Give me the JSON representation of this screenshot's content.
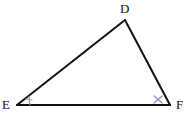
{
  "figure": {
    "kind": "geometry-diagram",
    "shape_name": "triangle",
    "background_color": "#ffffff",
    "stroke_color": "#111111",
    "stroke_width": 2,
    "mark_color": "#8a93b5",
    "width": 190,
    "height": 116,
    "vertices": [
      {
        "id": "D",
        "label": "D",
        "x": 125,
        "y": 20,
        "label_x": 120,
        "label_y": 2
      },
      {
        "id": "E",
        "label": "E",
        "x": 17,
        "y": 105,
        "label_x": 2,
        "label_y": 98
      },
      {
        "id": "F",
        "label": "F",
        "x": 170,
        "y": 105,
        "label_x": 176,
        "label_y": 98
      }
    ],
    "edges": [
      {
        "id": "ED",
        "from": "E",
        "to": "D"
      },
      {
        "id": "DF",
        "from": "D",
        "to": "F"
      },
      {
        "id": "EF",
        "from": "E",
        "to": "F"
      }
    ],
    "angle_marks": [
      {
        "id": "angle-E",
        "at": "E",
        "mark": "single-tick",
        "color": "#8a93b5"
      },
      {
        "id": "angle-F",
        "at": "F",
        "mark": "cross",
        "color": "#8a93b5"
      }
    ]
  }
}
